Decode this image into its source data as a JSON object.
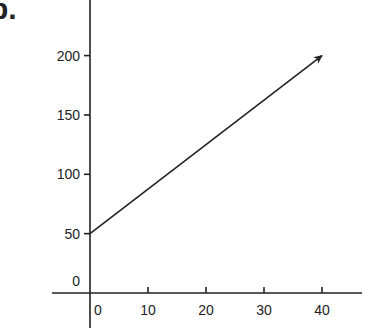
{
  "panel_label": "b.",
  "chart_data": {
    "type": "line",
    "title": "",
    "xlabel": "",
    "ylabel": "",
    "xlim": [
      0,
      45
    ],
    "ylim": [
      0,
      240
    ],
    "x_ticks": [
      0,
      10,
      20,
      30,
      40
    ],
    "y_ticks": [
      0,
      50,
      100,
      150,
      200
    ],
    "x_tick_labels": [
      "0",
      "10",
      "20",
      "30",
      "40"
    ],
    "y_tick_labels": [
      "0",
      "50",
      "100",
      "150",
      "200"
    ],
    "grid": false,
    "legend": "none",
    "series": [
      {
        "name": "line",
        "x": [
          0,
          40
        ],
        "y": [
          50,
          200
        ],
        "arrow_end": true,
        "color": "#222222"
      }
    ]
  }
}
